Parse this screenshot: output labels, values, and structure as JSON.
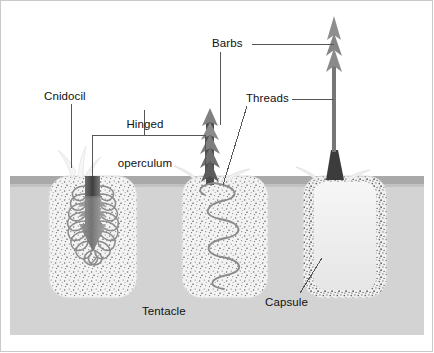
{
  "figure": {
    "background_color": "#ffffff",
    "frame_color": "#c9c9c9"
  },
  "labels": {
    "cnidocil": "Cnidocil",
    "hinged_operculum_line1": "Hinged",
    "hinged_operculum_line2": "operculum",
    "barbs": "Barbs",
    "threads": "Threads",
    "capsule": "Capsule",
    "tentacle": "Tentacle"
  },
  "colors": {
    "tentacle_body": "#d2d2d2",
    "tentacle_surface_band": "#a8a8a8",
    "capsule_fill": "#efefef",
    "capsule_speckle": "#6d6d6d",
    "thread_stroke": "#8a8a8a",
    "operculum_dark": "#4b4b4b",
    "barb_dark": "#5a5a5a",
    "barb_mid": "#8f8f8f",
    "cnidocil_pale": "#f2f2f2",
    "leader_line": "#555555",
    "text": "#111111"
  },
  "stages": [
    {
      "name": "undischarged-cnidocyte",
      "order": 1,
      "description": "Capsule with coiled inverted thread, cnidocil and hinged operculum visible at surface",
      "features": [
        "cnidocil",
        "hinged operculum",
        "coiled thread",
        "inverted barbed shaft"
      ]
    },
    {
      "name": "discharging-cnidocyte",
      "order": 2,
      "description": "Operculum open, barbed thread everting outward, helical coil remaining inside capsule",
      "features": [
        "hinged operculum",
        "barbs",
        "threads",
        "helical coil"
      ]
    },
    {
      "name": "discharged-cnidocyte",
      "order": 3,
      "description": "Empty capsule after full thread eversion, long barbed thread extended above the tentacle surface",
      "features": [
        "empty capsule",
        "extended thread",
        "barbs"
      ]
    }
  ],
  "label_positions": {
    "cnidocil": {
      "x": 47,
      "y": 91
    },
    "hinged_operculum": {
      "x": 118,
      "y": 94
    },
    "barbs": {
      "x": 212,
      "y": 37
    },
    "threads": {
      "x": 246,
      "y": 94
    },
    "capsule": {
      "x": 266,
      "y": 297
    },
    "tentacle": {
      "x": 142,
      "y": 306
    }
  }
}
